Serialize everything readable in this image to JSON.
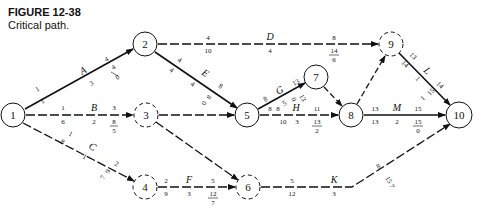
{
  "figure": {
    "title": "FIGURE 12-38",
    "caption": "Critical path."
  },
  "nodes": [
    {
      "id": "1",
      "label": "1",
      "x": 13,
      "y": 115,
      "style": "solid"
    },
    {
      "id": "2",
      "label": "2",
      "x": 145,
      "y": 44,
      "style": "solid"
    },
    {
      "id": "3",
      "label": "3",
      "x": 146,
      "y": 115,
      "style": "dashed"
    },
    {
      "id": "4",
      "label": "4",
      "x": 145,
      "y": 187,
      "style": "dashed"
    },
    {
      "id": "5",
      "label": "5",
      "x": 247,
      "y": 115,
      "style": "solid"
    },
    {
      "id": "6",
      "label": "6",
      "x": 248,
      "y": 187,
      "style": "dashed"
    },
    {
      "id": "7",
      "label": "7",
      "x": 316,
      "y": 77,
      "style": "solid"
    },
    {
      "id": "8",
      "label": "8",
      "x": 351,
      "y": 115,
      "style": "solid"
    },
    {
      "id": "9",
      "label": "9",
      "x": 391,
      "y": 44,
      "style": "dashed"
    },
    {
      "id": "10",
      "label": "10",
      "x": 459,
      "y": 115,
      "style": "solid"
    }
  ],
  "activities": [
    {
      "name": "A",
      "from": "1",
      "to": "2",
      "critical": true,
      "es": "1",
      "ls": "1",
      "duration": "3",
      "ef": "4",
      "lf": "4",
      "slack": "0"
    },
    {
      "name": "B",
      "from": "1",
      "to": "3",
      "critical": false,
      "es": "1",
      "ls": "6",
      "duration": "2",
      "ef": "3",
      "lf": "8",
      "slack": "5"
    },
    {
      "name": "C",
      "from": "1",
      "to": "4",
      "critical": false,
      "es": "1",
      "ls": "8",
      "duration": "1",
      "ef": "2",
      "lf": "9",
      "slack": "7"
    },
    {
      "name": "D",
      "from": "2",
      "to": "9",
      "critical": false,
      "es": "4",
      "ls": "10",
      "duration": "4",
      "ef": "8",
      "lf": "14",
      "slack": "6"
    },
    {
      "name": "E",
      "from": "2",
      "to": "5",
      "critical": true,
      "es": "4",
      "ls": "4",
      "duration": "4",
      "ef": "8",
      "lf": "8",
      "slack": "0"
    },
    {
      "name": "",
      "from": "3",
      "to": "5",
      "critical": false,
      "dummy": true
    },
    {
      "name": "",
      "from": "3",
      "to": "6",
      "critical": false,
      "dummy": true
    },
    {
      "name": "F",
      "from": "4",
      "to": "6",
      "critical": false,
      "es": "2",
      "ls": "9",
      "duration": "3",
      "ef": "5",
      "lf": "12",
      "slack": "7"
    },
    {
      "name": "G",
      "from": "5",
      "to": "7",
      "critical": true,
      "es": "8",
      "ls": "8",
      "duration": "5",
      "ef": "13",
      "lf": "13",
      "slack": "0"
    },
    {
      "name": "H",
      "from": "5",
      "to": "8",
      "critical": false,
      "es": "8",
      "ls": "10",
      "duration": "3",
      "ef": "11",
      "lf": "13",
      "slack": "2"
    },
    {
      "name": "",
      "from": "7",
      "to": "8",
      "critical": false,
      "dummy": true
    },
    {
      "name": "",
      "from": "8",
      "to": "9",
      "critical": false,
      "dummy": true
    },
    {
      "name": "K",
      "from": "6",
      "to": "10",
      "critical": false,
      "es": "5",
      "ls": "12",
      "duration": "3",
      "ef": "8",
      "lf": "15",
      "slack": "7"
    },
    {
      "name": "L",
      "from": "9",
      "to": "10",
      "critical": true,
      "es": "13",
      "ls": "14",
      "duration": "1",
      "ef": "14",
      "lf": "15",
      "slack": "1"
    },
    {
      "name": "M",
      "from": "8",
      "to": "10",
      "critical": true,
      "es": "13",
      "ls": "13",
      "duration": "2",
      "ef": "15",
      "lf": "15",
      "slack": "0"
    }
  ],
  "labels": {
    "A": {
      "name": "A",
      "es": "1",
      "ls": "1",
      "dur": "3",
      "ef": "4",
      "lf": "4",
      "sl": "0"
    },
    "B": {
      "name": "B",
      "es": "1",
      "ls": "6",
      "dur": "2",
      "ef": "3",
      "lf": "8",
      "sl": "5"
    },
    "C": {
      "name": "C",
      "es": "1",
      "ls": "8",
      "dur": "1",
      "ef": "2",
      "lf": "9",
      "sl": "7"
    },
    "D": {
      "name": "D",
      "es": "4",
      "ls": "10",
      "dur": "4",
      "ef": "8",
      "lf": "14",
      "sl": "6"
    },
    "E": {
      "name": "E",
      "es": "4",
      "ls": "4",
      "dur": "4",
      "ef": "8",
      "lf": "8",
      "sl": "0"
    },
    "F": {
      "name": "F",
      "es": "2",
      "ls": "9",
      "dur": "3",
      "ef": "5",
      "lf": "12",
      "sl": "7"
    },
    "G": {
      "name": "G",
      "es": "8",
      "ls": "8",
      "dur": "5",
      "ef": "13",
      "lf": "13",
      "sl": "0"
    },
    "H": {
      "name": "H",
      "es": "8",
      "ls": "10",
      "dur": "3",
      "ef": "11",
      "lf": "13",
      "sl": "2"
    },
    "K": {
      "name": "K",
      "es": "5",
      "ls": "12",
      "dur": "3",
      "ef": "8",
      "lf": "15",
      "sl": "7"
    },
    "L": {
      "name": "L",
      "es": "13",
      "ls": "14",
      "dur": "1",
      "ef": "14",
      "lf": "15",
      "sl": "1"
    },
    "M": {
      "name": "M",
      "es": "13",
      "ls": "13",
      "dur": "2",
      "ef": "15",
      "lf": "15",
      "sl": "0"
    }
  },
  "node_labels": {
    "n1": "1",
    "n2": "2",
    "n3": "3",
    "n4": "4",
    "n5": "5",
    "n6": "6",
    "n7": "7",
    "n8": "8",
    "n9": "9",
    "n10": "10"
  }
}
